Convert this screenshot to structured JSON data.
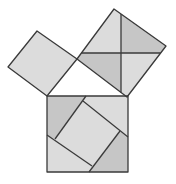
{
  "diagram": {
    "colors": {
      "background": "#ffffff",
      "light_fill": "#dcdcdc",
      "dark_fill": "#c6c6c6",
      "stroke": "#3a3a3a"
    },
    "triangle": {
      "vertices": [
        [
          47,
          96
        ],
        [
          128,
          96
        ],
        [
          77,
          59
        ]
      ],
      "right_angle_vertex": [
        77,
        59
      ]
    },
    "squares": [
      {
        "id": "leg-a-square",
        "corners": [
          [
            37,
            31
          ],
          [
            77,
            59
          ],
          [
            47,
            96
          ],
          [
            8,
            67
          ]
        ],
        "fill": "light"
      },
      {
        "id": "leg-b-square",
        "corners": [
          [
            114,
            9
          ],
          [
            166,
            46
          ],
          [
            127,
            97
          ],
          [
            77,
            59
          ]
        ],
        "fill": "light",
        "dividers": [
          {
            "from": [
              121,
              14
            ],
            "to": [
              121,
              92.4
            ]
          },
          {
            "from": [
              81.4,
              53
            ],
            "to": [
              160.6,
              53
            ]
          }
        ],
        "dark_pieces": [
          [
            [
              121,
              14
            ],
            [
              166,
              46
            ],
            [
              160.6,
              53
            ],
            [
              121,
              53
            ]
          ],
          [
            [
              81.4,
              53
            ],
            [
              121,
              53
            ],
            [
              121,
              92.4
            ],
            [
              77,
              59
            ]
          ]
        ]
      },
      {
        "id": "hypotenuse-square",
        "corners": [
          [
            47,
            96
          ],
          [
            128,
            96
          ],
          [
            128,
            172
          ],
          [
            47,
            172
          ]
        ],
        "fill": "light",
        "inner_square": [
          [
            83,
            101
          ],
          [
            120,
            131
          ],
          [
            92,
            166
          ],
          [
            55,
            139
          ]
        ],
        "cut_lines": [
          {
            "from": [
              86,
              96
            ],
            "to": [
              55,
              139
            ]
          },
          {
            "from": [
              83,
              101
            ],
            "to": [
              128,
              137
            ]
          },
          {
            "from": [
              120,
              131
            ],
            "to": [
              89,
              172
            ]
          },
          {
            "from": [
              47,
              135
            ],
            "to": [
              92,
              166
            ]
          }
        ],
        "dark_pieces": [
          [
            [
              47,
              96
            ],
            [
              86,
              96
            ],
            [
              55,
              139
            ],
            [
              47,
              135
            ]
          ],
          [
            [
              128,
              137
            ],
            [
              128,
              172
            ],
            [
              89,
              172
            ],
            [
              120,
              131
            ]
          ]
        ]
      }
    ]
  }
}
